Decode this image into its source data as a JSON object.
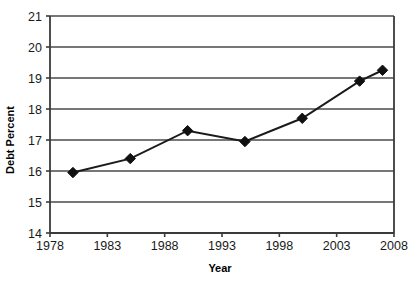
{
  "chart_data": {
    "type": "line",
    "title": "",
    "xlabel": "Year",
    "ylabel": "Debt Percent",
    "x": [
      1980,
      1985,
      1990,
      1995,
      2000,
      2005,
      2007
    ],
    "values": [
      15.95,
      16.4,
      17.3,
      16.95,
      17.7,
      18.9,
      19.25
    ],
    "series": [
      {
        "name": "Debt Percent",
        "values": [
          15.95,
          16.4,
          17.3,
          16.95,
          17.7,
          18.9,
          19.25
        ]
      }
    ],
    "xlim": [
      1978,
      2008
    ],
    "ylim": [
      14,
      21
    ],
    "xticks": [
      1978,
      1983,
      1988,
      1993,
      1998,
      2003,
      2008
    ],
    "yticks": [
      14,
      15,
      16,
      17,
      18,
      19,
      20,
      21
    ],
    "xtick_labels": [
      "1978",
      "1983",
      "1988",
      "1993",
      "1998",
      "2003",
      "2008"
    ],
    "ytick_labels": [
      "14",
      "15",
      "16",
      "17",
      "18",
      "19",
      "20",
      "21"
    ],
    "grid": "horizontal",
    "legend": "none",
    "marker": "diamond",
    "line_color": "#1b1b1b",
    "marker_color": "#101010",
    "grid_color": "#4a4a4a",
    "background": "#ffffff"
  }
}
